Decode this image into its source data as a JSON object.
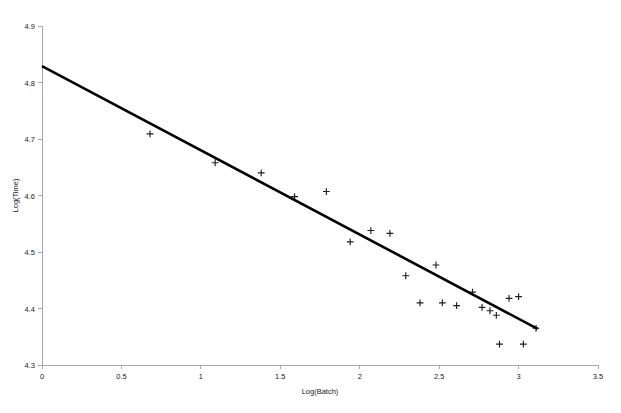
{
  "chart_data": {
    "type": "scatter",
    "title": "",
    "subtitle": "",
    "xlabel": "Log(Batch)",
    "ylabel": "Log(Time)",
    "xlim": [
      0,
      3.5
    ],
    "ylim": [
      4.3,
      4.9
    ],
    "xticks": [
      0,
      0.5,
      1,
      1.5,
      2,
      2.5,
      3,
      3.5
    ],
    "xtick_labels": [
      "0",
      "0.5",
      "1",
      "1.5",
      "2",
      "2.5",
      "3",
      "3.5"
    ],
    "yticks": [
      4.3,
      4.4,
      4.5,
      4.6,
      4.7,
      4.8,
      4.9
    ],
    "ytick_labels": [
      "4.3",
      "4.4",
      "4.5",
      "4.6",
      "4.7",
      "4.8",
      "4.9"
    ],
    "grid": false,
    "legend": false,
    "legend_position": "none",
    "marker_style": "plus",
    "marker_color": "#1f1f1f",
    "line_color": "#000000",
    "axis_color": "#a8a8a8",
    "series": [
      {
        "name": "observations",
        "type": "scatter",
        "points": [
          {
            "x": 0.68,
            "y": 4.709
          },
          {
            "x": 1.09,
            "y": 4.658
          },
          {
            "x": 1.38,
            "y": 4.64
          },
          {
            "x": 1.59,
            "y": 4.598
          },
          {
            "x": 1.79,
            "y": 4.607
          },
          {
            "x": 1.94,
            "y": 4.518
          },
          {
            "x": 2.07,
            "y": 4.538
          },
          {
            "x": 2.19,
            "y": 4.533
          },
          {
            "x": 2.29,
            "y": 4.458
          },
          {
            "x": 2.38,
            "y": 4.41
          },
          {
            "x": 2.48,
            "y": 4.477
          },
          {
            "x": 2.52,
            "y": 4.41
          },
          {
            "x": 2.61,
            "y": 4.405
          },
          {
            "x": 2.71,
            "y": 4.429
          },
          {
            "x": 2.77,
            "y": 4.402
          },
          {
            "x": 2.82,
            "y": 4.396
          },
          {
            "x": 2.86,
            "y": 4.388
          },
          {
            "x": 2.88,
            "y": 4.337
          },
          {
            "x": 2.94,
            "y": 4.418
          },
          {
            "x": 3.0,
            "y": 4.421
          },
          {
            "x": 3.03,
            "y": 4.337
          },
          {
            "x": 3.11,
            "y": 4.365
          }
        ]
      },
      {
        "name": "regression-line",
        "type": "line",
        "points": [
          {
            "x": 0.0,
            "y": 4.829
          },
          {
            "x": 3.12,
            "y": 4.364
          }
        ]
      }
    ]
  },
  "chart": {
    "axis_x_name": "x-axis",
    "axis_y_name": "y-axis"
  }
}
